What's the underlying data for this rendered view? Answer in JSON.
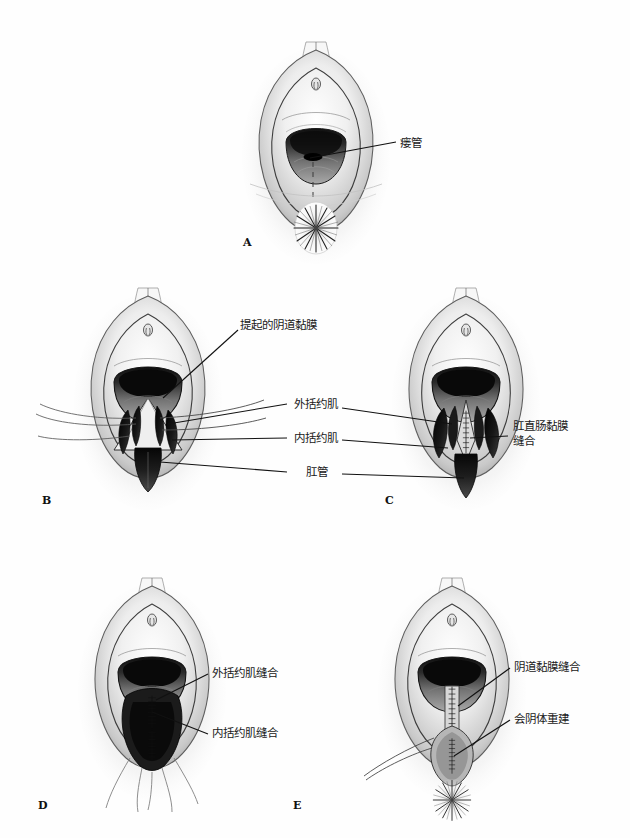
{
  "figure": {
    "title": "",
    "background_color": "#fefefe",
    "ink_color": "#1a1a1a",
    "panel_count": 5
  },
  "panels": [
    {
      "id": "A",
      "letter": "A",
      "labels": [
        {
          "id": "fistula",
          "text": "瘘管"
        }
      ]
    },
    {
      "id": "B",
      "letter": "B",
      "labels": [
        {
          "id": "elevated-vaginal-mucosa",
          "text": "提起的阴道黏膜"
        },
        {
          "id": "external-sphincter",
          "text": "外括约肌"
        },
        {
          "id": "internal-sphincter",
          "text": "内括约肌"
        },
        {
          "id": "anal-canal",
          "text": "肛管"
        }
      ]
    },
    {
      "id": "C",
      "letter": "C",
      "labels": [
        {
          "id": "anorectal-mucosa-suture",
          "text": "肛直肠黏膜缝合"
        }
      ]
    },
    {
      "id": "D",
      "letter": "D",
      "labels": [
        {
          "id": "external-sphincter-suture",
          "text": "外括约肌缝合"
        },
        {
          "id": "internal-sphincter-suture",
          "text": "内括约肌缝合"
        }
      ]
    },
    {
      "id": "E",
      "letter": "E",
      "labels": [
        {
          "id": "vaginal-mucosa-suture",
          "text": "阴道黏膜缝合"
        },
        {
          "id": "perineal-body-reconstruction",
          "text": "会阴体重建"
        }
      ]
    }
  ],
  "colors": {
    "ink": "#1a1a1a",
    "leader_line": "#111111",
    "tissue_light": "#f2f2f2",
    "tissue_mid": "#b9b9b9",
    "tissue_dark": "#6e6e6e",
    "tissue_darkest": "#161616",
    "muscle": "#0d0d0d",
    "page": "#fefefe"
  }
}
